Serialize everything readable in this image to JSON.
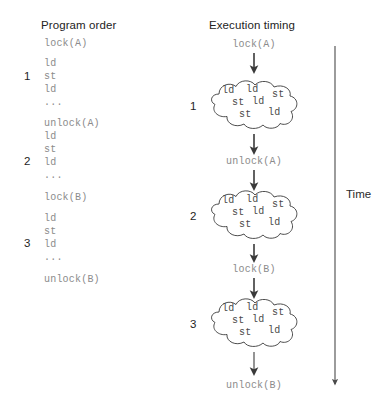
{
  "figure": {
    "headings": {
      "program_order": "Program order",
      "execution_timing": "Execution timing"
    },
    "time_axis": {
      "label": "Time",
      "direction": "downward"
    }
  },
  "program_order": {
    "lines": [
      {
        "text": "lock(A)",
        "kind": "lock"
      },
      {
        "text": "ld",
        "kind": "op"
      },
      {
        "text": "st",
        "kind": "op"
      },
      {
        "text": "ld",
        "kind": "op"
      },
      {
        "text": "...",
        "kind": "ellipsis"
      },
      {
        "text": "unlock(A)",
        "kind": "unlock"
      },
      {
        "text": "ld",
        "kind": "op"
      },
      {
        "text": "st",
        "kind": "op"
      },
      {
        "text": "ld",
        "kind": "op"
      },
      {
        "text": "...",
        "kind": "ellipsis"
      },
      {
        "text": "lock(B)",
        "kind": "lock"
      },
      {
        "text": "ld",
        "kind": "op"
      },
      {
        "text": "st",
        "kind": "op"
      },
      {
        "text": "ld",
        "kind": "op"
      },
      {
        "text": "...",
        "kind": "ellipsis"
      },
      {
        "text": "unlock(B)",
        "kind": "unlock"
      }
    ],
    "group_numbers": [
      "1",
      "2",
      "3"
    ]
  },
  "execution_timing": {
    "sequence": [
      {
        "type": "label",
        "text": "lock(A)"
      },
      {
        "type": "cloud",
        "number": "1"
      },
      {
        "type": "label",
        "text": "unlock(A)"
      },
      {
        "type": "cloud",
        "number": "2"
      },
      {
        "type": "label",
        "text": "lock(B)"
      },
      {
        "type": "cloud",
        "number": "3"
      },
      {
        "type": "label",
        "text": "unlock(B)"
      }
    ],
    "cloud_contents": {
      "row1": [
        "ld",
        "ld",
        "st"
      ],
      "row2": [
        "st",
        "ld"
      ],
      "row3": [
        "st",
        "ld"
      ]
    }
  },
  "colors": {
    "code_text": "#8b8b8b",
    "heading_text": "#232323",
    "stroke": "#3a3a3a",
    "cloud_op_text": "#4a4a4a",
    "background": "#ffffff"
  }
}
